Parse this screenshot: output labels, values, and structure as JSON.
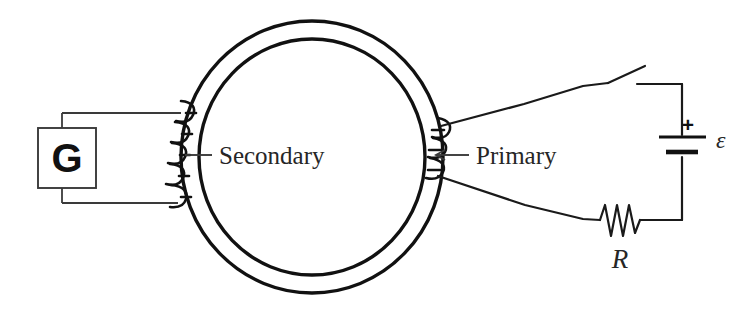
{
  "figure": {
    "background_color": "#ffffff",
    "ink_color": "#1a1a1a"
  },
  "labels": {
    "galvanometer": "G",
    "secondary": "Secondary",
    "primary": "Primary",
    "resistor": "R",
    "emf": "ε",
    "battery_polarity": "+"
  },
  "components": [
    {
      "name": "galvanometer",
      "symbol": "G",
      "role": "meter on secondary circuit",
      "position": "left"
    },
    {
      "name": "toroidal-core",
      "symbol": "annulus",
      "role": "iron core linking the two coils",
      "position": "center"
    },
    {
      "name": "secondary-winding",
      "symbol": "coil",
      "role": "secondary coil wound on left of core",
      "turns": 5,
      "position": "center-left"
    },
    {
      "name": "primary-winding",
      "symbol": "coil",
      "role": "primary coil wound on right of core",
      "turns": 3,
      "position": "center-right"
    },
    {
      "name": "switch",
      "symbol": "open-switch",
      "role": "opens and closes the primary circuit",
      "state": "open",
      "position": "top-right"
    },
    {
      "name": "battery",
      "symbol": "cell",
      "role": "emf source driving the primary",
      "polarity": "+",
      "value_label": "ε",
      "position": "right"
    },
    {
      "name": "resistor",
      "symbol": "zigzag",
      "role": "resistance in the primary circuit",
      "value_label": "R",
      "position": "bottom-right"
    }
  ],
  "colors": {
    "ink": "#1a1a1a",
    "core": "#111111",
    "thin_wire": "#3a3a3a",
    "text": "#262626",
    "background": "#ffffff"
  }
}
